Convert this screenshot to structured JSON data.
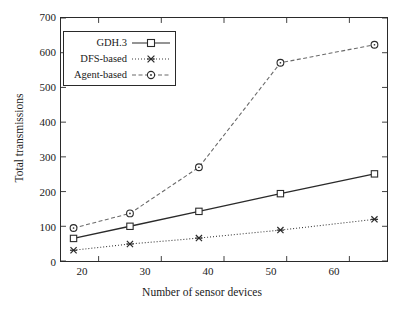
{
  "chart_data": {
    "type": "line",
    "title": "",
    "xlabel": "Number of sensor devices",
    "ylabel": "Total transmissions",
    "x": [
      16,
      25,
      36,
      49,
      64
    ],
    "xlim": [
      14,
      66
    ],
    "ylim": [
      0,
      700
    ],
    "xticks": [
      "20",
      "30",
      "40",
      "50",
      "60"
    ],
    "xtick_values": [
      20,
      30,
      40,
      50,
      60
    ],
    "yticks": [
      "0",
      "100",
      "200",
      "300",
      "400",
      "500",
      "600",
      "700"
    ],
    "ytick_values": [
      0,
      100,
      200,
      300,
      400,
      500,
      600,
      700
    ],
    "grid": false,
    "legend_position": "upper left",
    "series": [
      {
        "name": "GDH.3",
        "values": [
          65,
          100,
          143,
          194,
          251
        ],
        "marker": "open-square",
        "line_style": "solid",
        "color": "#2a2a2a"
      },
      {
        "name": "DFS-based",
        "values": [
          31,
          49,
          66,
          89,
          120
        ],
        "marker": "star",
        "line_style": "dotted",
        "color": "#3a3a3a"
      },
      {
        "name": "Agent-based",
        "values": [
          95,
          137,
          270,
          571,
          623
        ],
        "marker": "open-circle",
        "line_style": "dashed",
        "color": "#6a6a6a"
      }
    ]
  },
  "legend": {
    "items": [
      {
        "label": "GDH.3"
      },
      {
        "label": "DFS-based"
      },
      {
        "label": "Agent-based"
      }
    ]
  }
}
